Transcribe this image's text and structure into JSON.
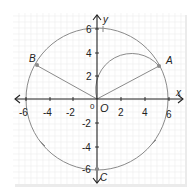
{
  "axes": {
    "x_label": "x",
    "y_label": "y",
    "x_ticks": [
      {
        "value": -6,
        "label": "-6"
      },
      {
        "value": -4,
        "label": "-4"
      },
      {
        "value": -2,
        "label": "-2"
      },
      {
        "value": 2,
        "label": "2"
      },
      {
        "value": 4,
        "label": "4"
      },
      {
        "value": 6,
        "label": "6"
      }
    ],
    "y_ticks": [
      {
        "value": 6,
        "label": "6"
      },
      {
        "value": 4,
        "label": "4"
      },
      {
        "value": 2,
        "label": "2"
      },
      {
        "value": -2,
        "label": "-2"
      },
      {
        "value": -4,
        "label": "-4"
      },
      {
        "value": -6,
        "label": "-6"
      }
    ],
    "origin_label": "0"
  },
  "points": {
    "O": {
      "label": "O",
      "x": 0,
      "y": 0
    },
    "A": {
      "label": "A",
      "x": 5.2,
      "y": 3
    },
    "B": {
      "label": "B",
      "x": -5.2,
      "y": 3
    },
    "C": {
      "label": "C",
      "x": 0,
      "y": -6
    }
  },
  "shapes": {
    "circle": {
      "center": [
        0,
        0
      ],
      "radius": 6
    },
    "semicircle": {
      "diameter_from": "O",
      "diameter_to": "A"
    },
    "segments": [
      [
        "O",
        "A"
      ],
      [
        "O",
        "B"
      ],
      [
        "O",
        "C"
      ]
    ]
  },
  "colors": {
    "grid": "#e6e6e6",
    "curve": "#8a8a8a",
    "axis": "#222222",
    "point": "#8a8a8a"
  }
}
